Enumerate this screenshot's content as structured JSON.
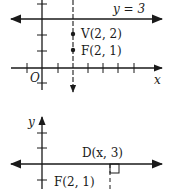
{
  "top_graph": {
    "directrix_label": "y = 3",
    "point_v_label": "V(2, 2)",
    "point_f_label": "F(2, 1)",
    "origin_label": "O",
    "x_axis_label": "x"
  },
  "bottom_graph": {
    "y_axis_label": "y",
    "point_d_label": "D(x, 3)",
    "point_f_label": "F(2, 1)"
  },
  "colors": {
    "ink": "#1a1a1a",
    "background": "#ffffff"
  }
}
